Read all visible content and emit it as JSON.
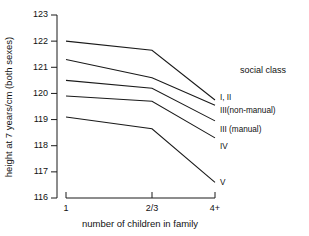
{
  "chart_data": {
    "type": "line",
    "title": "",
    "xlabel": "number of children in family",
    "ylabel": "height at 7 years/cm (both sexes)",
    "categories": [
      "1",
      "2/3",
      "4+"
    ],
    "xtick_labels": [
      "1",
      "2/3",
      "4+"
    ],
    "ytick_labels": [
      "116",
      "117",
      "118",
      "119",
      "120",
      "121",
      "122",
      "123"
    ],
    "ylim": [
      116,
      123
    ],
    "grid": false,
    "legend_position": "right",
    "legend_title": "social class",
    "series": [
      {
        "name": "I, II",
        "values": [
          122.0,
          121.65,
          119.75
        ]
      },
      {
        "name": "III(non-manual)",
        "values": [
          121.3,
          120.6,
          119.55
        ]
      },
      {
        "name": "III (manual)",
        "values": [
          120.5,
          120.2,
          118.95
        ]
      },
      {
        "name": "IV",
        "values": [
          119.9,
          119.7,
          118.3
        ]
      },
      {
        "name": "V",
        "values": [
          119.1,
          118.65,
          116.6
        ]
      }
    ]
  },
  "axes": {
    "y_title": "height at 7 years/cm (both sexes)",
    "x_title": "number of children in family"
  },
  "legend": {
    "title": "social class",
    "entries": [
      "I, II",
      "III(non-manual)",
      "III (manual)",
      "IV",
      "V"
    ]
  }
}
